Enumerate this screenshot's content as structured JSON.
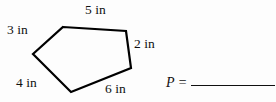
{
  "figure": {
    "shape_name": "pentagon",
    "stroke_color": "#000000",
    "fill_color": "none",
    "background_color": "#fdfdfd",
    "vertices": [
      {
        "x": 63,
        "y": 27
      },
      {
        "x": 126,
        "y": 31
      },
      {
        "x": 131,
        "y": 68
      },
      {
        "x": 71,
        "y": 92
      },
      {
        "x": 33,
        "y": 54
      }
    ],
    "side_labels": [
      {
        "id": "3in",
        "text": "3 in",
        "value": 3,
        "unit": "in",
        "position": "upper-left"
      },
      {
        "id": "5in",
        "text": "5 in",
        "value": 5,
        "unit": "in",
        "position": "top"
      },
      {
        "id": "2in",
        "text": "2 in",
        "value": 2,
        "unit": "in",
        "position": "right"
      },
      {
        "id": "4in",
        "text": "4 in",
        "value": 4,
        "unit": "in",
        "position": "lower-left"
      },
      {
        "id": "6in",
        "text": "6 in",
        "value": 6,
        "unit": "in",
        "position": "bottom"
      }
    ]
  },
  "answer": {
    "symbol": "P =",
    "value": ""
  }
}
